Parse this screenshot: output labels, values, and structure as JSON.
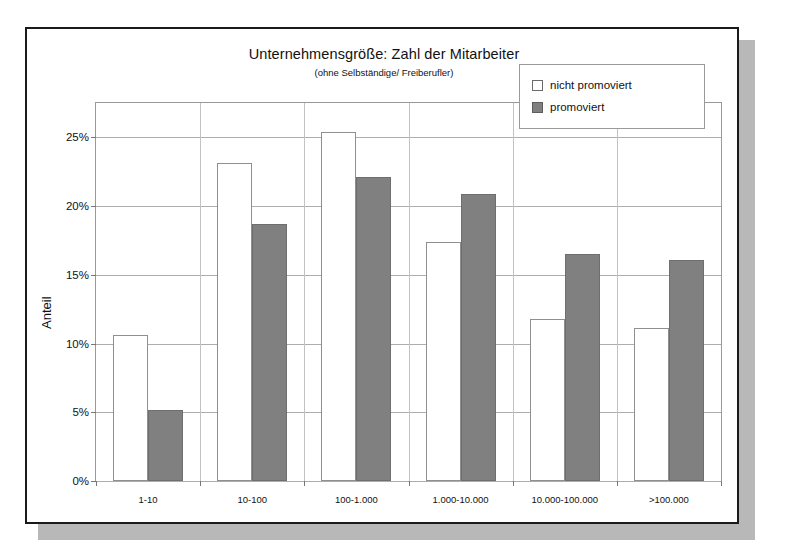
{
  "figure": {
    "title": "Unternehmensgröße: Zahl der Mitarbeiter",
    "subtitle": "(ohne Selbständige/ Freiberufler)"
  },
  "legend": {
    "position": "top-right",
    "entries": [
      {
        "label": "nicht promoviert",
        "swatch": "white-square"
      },
      {
        "label": "promoviert",
        "swatch": "gray-square"
      }
    ]
  },
  "axes": {
    "ylabel": "Anteil",
    "yticks": [
      "0%",
      "5%",
      "10%",
      "15%",
      "20%",
      "25%"
    ],
    "xlabel": ""
  },
  "colors": {
    "bar_light_fill": "#ffffff",
    "bar_light_border": "#8f8f8f",
    "bar_dark_fill": "#808080",
    "bar_dark_border": "#6e6e6e",
    "grid": "#adadad",
    "frame": "#1a1a1a",
    "shadow": "#b8b8b8"
  },
  "chart_data": {
    "type": "bar",
    "title": "Unternehmensgröße: Zahl der Mitarbeiter",
    "subtitle": "(ohne Selbständige/ Freiberufler)",
    "xlabel": "",
    "ylabel": "Anteil",
    "ylim": [
      0,
      27.5
    ],
    "ytick_values": [
      0,
      5,
      10,
      15,
      20,
      25
    ],
    "ytick_labels": [
      "0%",
      "5%",
      "10%",
      "15%",
      "20%",
      "25%"
    ],
    "grid": true,
    "legend_position": "top-right",
    "categories": [
      "1-10",
      "10-100",
      "100-1.000",
      "1.000-10.000",
      "10.000-100.000",
      ">100.000"
    ],
    "series": [
      {
        "name": "nicht promoviert",
        "values": [
          10.6,
          23.1,
          25.4,
          17.4,
          11.8,
          11.1
        ]
      },
      {
        "name": "promoviert",
        "values": [
          5.2,
          18.7,
          22.1,
          20.9,
          16.5,
          16.1
        ]
      }
    ]
  }
}
